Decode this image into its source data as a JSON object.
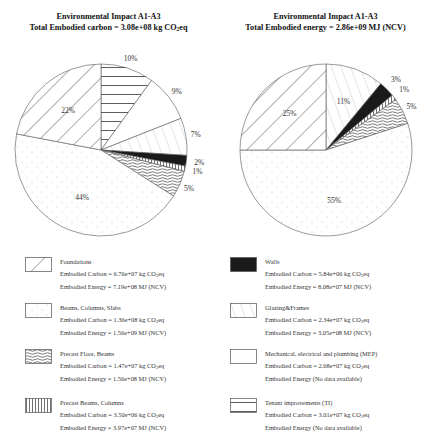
{
  "chart_data": [
    {
      "type": "pie",
      "title": "Environmental Impact A1-A3",
      "subtitle": "Total Embodied carbon = 3.08e+08 kg CO2eq",
      "subtitle_prefix": "Total Embodied carbon = 3.08e+08 kg CO",
      "subtitle_sub": "2",
      "subtitle_suffix": "eq",
      "start": "12 o'clock",
      "direction": "clockwise",
      "slices": [
        {
          "name": "Tenant improvements (TI)",
          "value": 10,
          "label": "10%",
          "pattern": "hlines"
        },
        {
          "name": "Mechanical, electrical and plumbing (MEP)",
          "value": 9,
          "label": "9%",
          "pattern": "blank"
        },
        {
          "name": "Glazing&Frames",
          "value": 7,
          "label": "7%",
          "pattern": "diag-light"
        },
        {
          "name": "Walls",
          "value": 2,
          "label": "2%",
          "pattern": "solid"
        },
        {
          "name": "Precast Beams, Columns",
          "value": 1,
          "label": "1%",
          "pattern": "vlines"
        },
        {
          "name": "Precast Floor, Beams",
          "value": 5,
          "label": "5%",
          "pattern": "waves"
        },
        {
          "name": "Beams, Columns, Slabs",
          "value": 44,
          "label": "44%",
          "pattern": "dots"
        },
        {
          "name": "Foundations",
          "value": 22,
          "label": "22%",
          "pattern": "diag-wide"
        }
      ]
    },
    {
      "type": "pie",
      "title": "Environmental Impact A1-A3",
      "subtitle": "Total Embodied energy = 2.86e+09 MJ (NCV)",
      "start": "12 o'clock",
      "direction": "clockwise",
      "slices": [
        {
          "name": "Glazing&Frames",
          "value": 11,
          "label": "11%",
          "pattern": "diag-light"
        },
        {
          "name": "Walls",
          "value": 3,
          "label": "3%",
          "pattern": "solid"
        },
        {
          "name": "Precast Beams, Columns",
          "value": 1,
          "label": "1%",
          "pattern": "vlines"
        },
        {
          "name": "Precast Floor, Beams",
          "value": 5,
          "label": "5%",
          "pattern": "waves"
        },
        {
          "name": "Beams, Columns, Slabs",
          "value": 55,
          "label": "55%",
          "pattern": "dots"
        },
        {
          "name": "Foundations",
          "value": 25,
          "label": "25%",
          "pattern": "diag-wide"
        }
      ]
    }
  ],
  "legend": [
    {
      "name": "Foundations",
      "pattern": "diag-wide",
      "carbon_prefix": "Embodied Carbon  = 6.76e+07 kg CO",
      "energy": "Embodied Energy = 7.19e+08 MJ (NCV)"
    },
    {
      "name": "Beams, Columns, Slabs",
      "pattern": "dots",
      "carbon_prefix": "Embodied Carbon  = 1.36e+08 kg CO",
      "energy": "Embodied Energy = 1.56e+09 MJ (NCV)"
    },
    {
      "name": "Precast Floor, Beams",
      "pattern": "waves",
      "carbon_prefix": "Embodied Carbon  = 1.47e+07 kg CO",
      "energy": "Embodied Energy = 1.56e+08 MJ (NCV)"
    },
    {
      "name": "Precast Beams, Columns",
      "pattern": "vlines",
      "carbon_prefix": "Embodied Carbon  = 3.50e+06 kg CO",
      "energy": "Embodied Energy = 3.97e+07 MJ (NCV)"
    },
    {
      "name": "Walls",
      "pattern": "solid",
      "carbon_prefix": "Embodied Carbon =  5.84e+06 kg CO",
      "energy": "Embodied Energy = 8.08e+07 MJ (NCV)"
    },
    {
      "name": "Glazing&Frames",
      "pattern": "diag-light",
      "carbon_prefix": "Embodied Carbon = 2.34e+07 kg CO",
      "energy": "Embodied Energy = 3.05e+08 MJ (NCV)"
    },
    {
      "name": "Mechanical, electrical and plumbing (MEP)",
      "pattern": "blank",
      "carbon_prefix": "Embodied Carbon = 2.68e+07 kg CO",
      "energy": "Embodied Energy  (No data available)"
    },
    {
      "name": "Tenant improvements (TI)",
      "pattern": "hlines",
      "carbon_prefix": "Embodied Carbon = 3.01e+07 kg CO",
      "energy": "Embodied Energy  (No data available)"
    }
  ],
  "co2_sub": "2",
  "co2_suffix": "eq",
  "colors": {
    "stroke": "#555555",
    "solid": "#1a1a1a",
    "hatch": "#333333",
    "dots": "#c8c8c8"
  }
}
